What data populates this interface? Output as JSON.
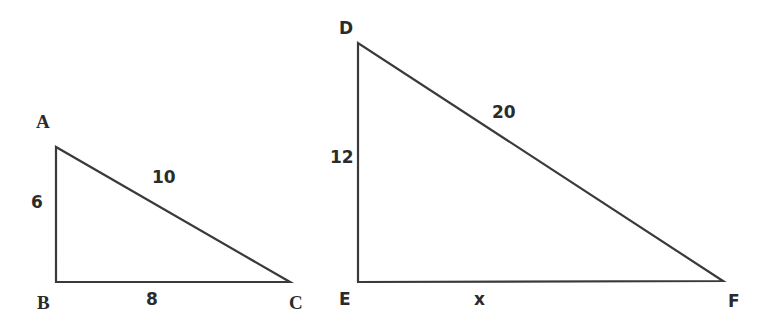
{
  "triangles": [
    {
      "id": "ABC",
      "vertices": {
        "A": {
          "label": "A",
          "x": 56,
          "y": 147
        },
        "B": {
          "label": "B",
          "x": 56,
          "y": 282
        },
        "C": {
          "label": "C",
          "x": 290,
          "y": 282
        }
      },
      "sides": {
        "AB": "6",
        "BC": "8",
        "AC": "10"
      },
      "right_angle_at": "B"
    },
    {
      "id": "DEF",
      "vertices": {
        "D": {
          "label": "D",
          "x": 358,
          "y": 43
        },
        "E": {
          "label": "E",
          "x": 358,
          "y": 282
        },
        "F": {
          "label": "F",
          "x": 723,
          "y": 281
        }
      },
      "sides": {
        "DE": "12",
        "EF": "x",
        "DF": "20"
      },
      "right_angle_at": "E"
    }
  ],
  "style": {
    "stroke_color": "#3a3a3a",
    "text_color": "#2b2b2b",
    "background": "#ffffff"
  }
}
